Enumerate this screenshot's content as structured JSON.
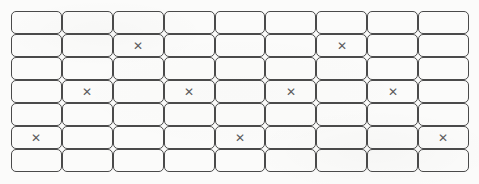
{
  "sheet": {
    "title": "Answer grid sheet",
    "mark_glyph": "✕",
    "rows": 7,
    "columns": 9,
    "stroke_color": "#4a4a4a",
    "mark_color": "#5c5c5c",
    "background_color": "#fbfbfa"
  },
  "grid": {
    "cells": [
      [
        "",
        "",
        "",
        "",
        "",
        "",
        "",
        "",
        ""
      ],
      [
        "",
        "",
        "✕",
        "",
        "",
        "",
        "✕",
        "",
        ""
      ],
      [
        "",
        "",
        "",
        "",
        "",
        "",
        "",
        "",
        ""
      ],
      [
        "",
        "✕",
        "",
        "✕",
        "",
        "✕",
        "",
        "✕",
        ""
      ],
      [
        "",
        "",
        "",
        "",
        "",
        "",
        "",
        "",
        ""
      ],
      [
        "✕",
        "",
        "",
        "",
        "✕",
        "",
        "",
        "",
        "✕"
      ],
      [
        "",
        "",
        "",
        "",
        "",
        "",
        "",
        "",
        ""
      ]
    ]
  }
}
